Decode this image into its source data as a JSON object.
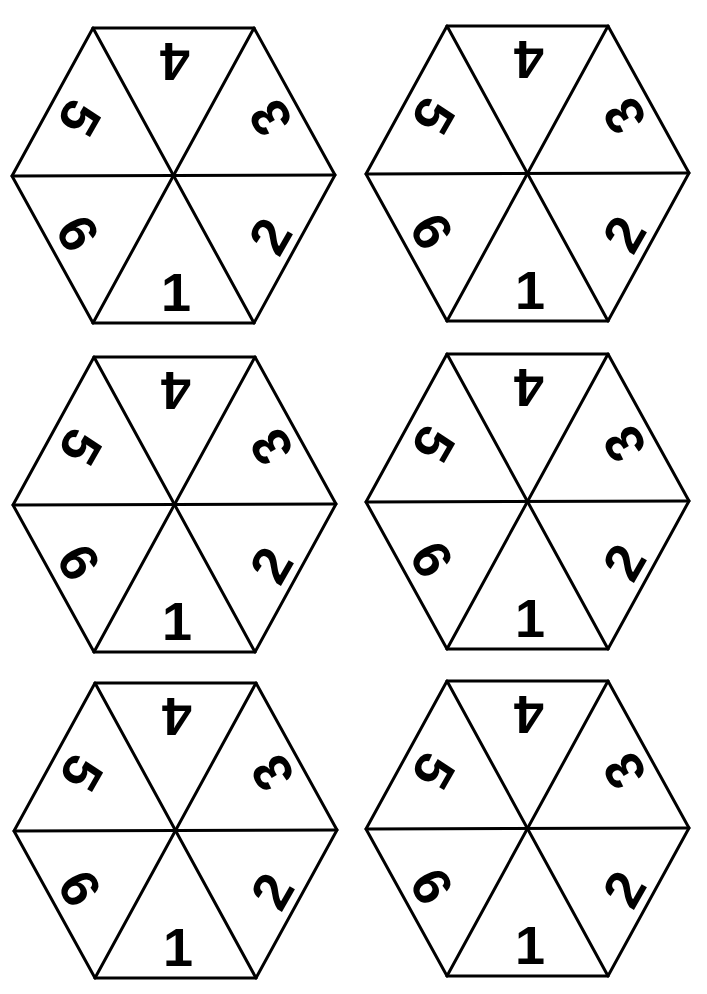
{
  "sheet": {
    "description": "Printable hexagonal spinner sheet with six spinners, each divided into six numbered triangles",
    "colors": {
      "background": "#ffffff",
      "ink": "#000000"
    }
  },
  "spinners": [
    {
      "id": "spinner-1",
      "center": [
        173,
        176
      ],
      "faces": [
        {
          "label": "1",
          "position": "bottom"
        },
        {
          "label": "2",
          "position": "bottom-right"
        },
        {
          "label": "3",
          "position": "top-right"
        },
        {
          "label": "4",
          "position": "top"
        },
        {
          "label": "5",
          "position": "top-left"
        },
        {
          "label": "6",
          "position": "bottom-left"
        }
      ]
    },
    {
      "id": "spinner-2",
      "center": [
        527,
        174
      ],
      "faces": [
        {
          "label": "1",
          "position": "bottom"
        },
        {
          "label": "2",
          "position": "bottom-right"
        },
        {
          "label": "3",
          "position": "top-right"
        },
        {
          "label": "4",
          "position": "top"
        },
        {
          "label": "5",
          "position": "top-left"
        },
        {
          "label": "6",
          "position": "bottom-left"
        }
      ]
    },
    {
      "id": "spinner-3",
      "center": [
        174,
        505
      ],
      "faces": [
        {
          "label": "1",
          "position": "bottom"
        },
        {
          "label": "2",
          "position": "bottom-right"
        },
        {
          "label": "3",
          "position": "top-right"
        },
        {
          "label": "4",
          "position": "top"
        },
        {
          "label": "5",
          "position": "top-left"
        },
        {
          "label": "6",
          "position": "bottom-left"
        }
      ]
    },
    {
      "id": "spinner-4",
      "center": [
        527,
        502
      ],
      "faces": [
        {
          "label": "1",
          "position": "bottom"
        },
        {
          "label": "2",
          "position": "bottom-right"
        },
        {
          "label": "3",
          "position": "top-right"
        },
        {
          "label": "4",
          "position": "top"
        },
        {
          "label": "5",
          "position": "top-left"
        },
        {
          "label": "6",
          "position": "bottom-left"
        }
      ]
    },
    {
      "id": "spinner-5",
      "center": [
        175,
        831
      ],
      "faces": [
        {
          "label": "1",
          "position": "bottom"
        },
        {
          "label": "2",
          "position": "bottom-right"
        },
        {
          "label": "3",
          "position": "top-right"
        },
        {
          "label": "4",
          "position": "top"
        },
        {
          "label": "5",
          "position": "top-left"
        },
        {
          "label": "6",
          "position": "bottom-left"
        }
      ]
    },
    {
      "id": "spinner-6",
      "center": [
        527,
        829
      ],
      "faces": [
        {
          "label": "1",
          "position": "bottom"
        },
        {
          "label": "2",
          "position": "bottom-right"
        },
        {
          "label": "3",
          "position": "top-right"
        },
        {
          "label": "4",
          "position": "top"
        },
        {
          "label": "5",
          "position": "top-left"
        },
        {
          "label": "6",
          "position": "bottom-left"
        }
      ]
    }
  ]
}
